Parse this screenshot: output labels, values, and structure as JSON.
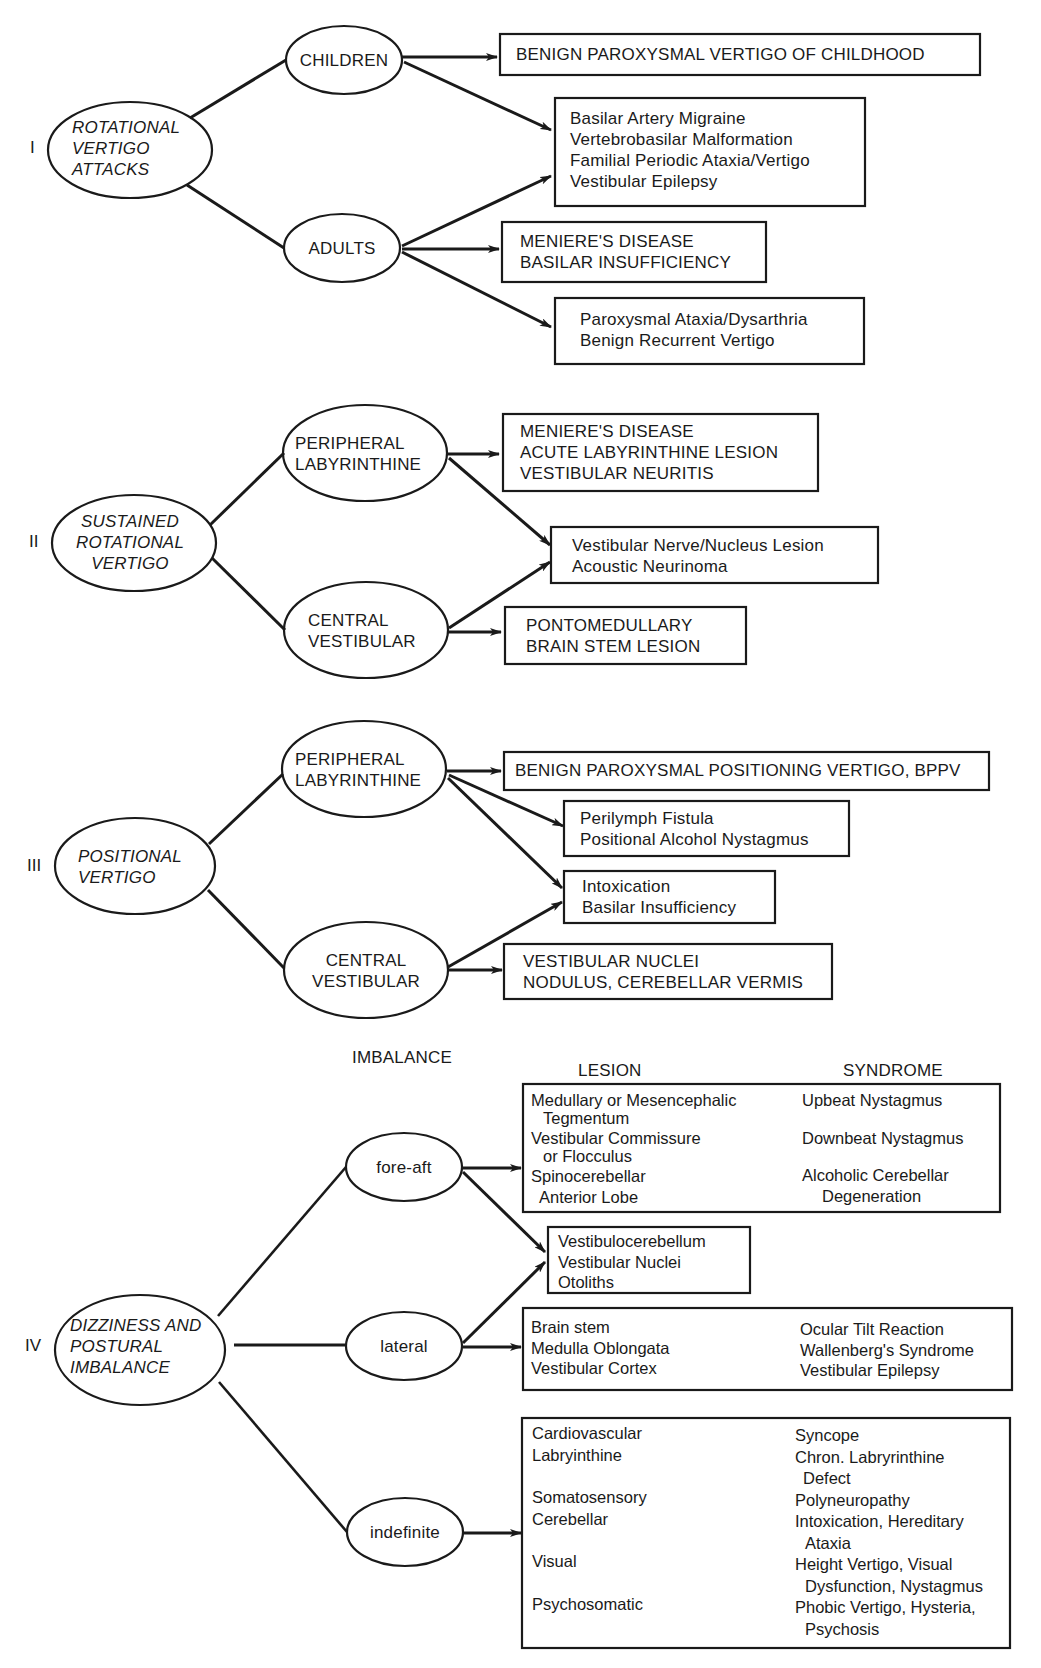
{
  "sections": [
    {
      "numeral": "I",
      "root": [
        "ROTATIONAL",
        "VERTIGO",
        "ATTACKS"
      ],
      "branches": [
        {
          "label": [
            "CHILDREN"
          ]
        },
        {
          "label": [
            "ADULTS"
          ]
        }
      ],
      "outcomes": [
        {
          "lines": [
            "BENIGN PAROXYSMAL VERTIGO OF CHILDHOOD"
          ],
          "from": [
            "CHILDREN"
          ]
        },
        {
          "lines": [
            "Basilar Artery Migraine",
            "Vertebrobasilar Malformation",
            "Familial Periodic Ataxia/Vertigo",
            "Vestibular Epilepsy"
          ],
          "from": [
            "CHILDREN",
            "ADULTS"
          ]
        },
        {
          "lines": [
            "MENIERE'S DISEASE",
            "BASILAR INSUFFICIENCY"
          ],
          "from": [
            "ADULTS"
          ]
        },
        {
          "lines": [
            "Paroxysmal Ataxia/Dysarthria",
            "Benign Recurrent Vertigo"
          ],
          "from": [
            "ADULTS"
          ]
        }
      ]
    },
    {
      "numeral": "II",
      "root": [
        "SUSTAINED",
        "ROTATIONAL",
        "VERTIGO"
      ],
      "branches": [
        {
          "label": [
            "PERIPHERAL",
            "LABYRINTHINE"
          ]
        },
        {
          "label": [
            "CENTRAL",
            "VESTIBULAR"
          ]
        }
      ],
      "outcomes": [
        {
          "lines": [
            "MENIERE'S DISEASE",
            "ACUTE LABYRINTHINE LESION",
            "VESTIBULAR NEURITIS"
          ],
          "from": [
            "PERIPHERAL LABYRINTHINE"
          ]
        },
        {
          "lines": [
            "Vestibular Nerve/Nucleus Lesion",
            "Acoustic Neurinoma"
          ],
          "from": [
            "PERIPHERAL LABYRINTHINE",
            "CENTRAL VESTIBULAR"
          ]
        },
        {
          "lines": [
            "PONTOMEDULLARY",
            "BRAIN STEM LESION"
          ],
          "from": [
            "CENTRAL VESTIBULAR"
          ]
        }
      ]
    },
    {
      "numeral": "III",
      "root": [
        "POSITIONAL",
        "VERTIGO"
      ],
      "branches": [
        {
          "label": [
            "PERIPHERAL",
            "LABYRINTHINE"
          ]
        },
        {
          "label": [
            "CENTRAL",
            "VESTIBULAR"
          ]
        }
      ],
      "outcomes": [
        {
          "lines": [
            "BENIGN PAROXYSMAL POSITIONING VERTIGO, BPPV"
          ],
          "from": [
            "PERIPHERAL LABYRINTHINE"
          ]
        },
        {
          "lines": [
            "Perilymph Fistula",
            "Positional Alcohol Nystagmus"
          ],
          "from": [
            "PERIPHERAL LABYRINTHINE"
          ]
        },
        {
          "lines": [
            "Intoxication",
            "Basilar Insufficiency"
          ],
          "from": [
            "PERIPHERAL LABYRINTHINE",
            "CENTRAL VESTIBULAR"
          ]
        },
        {
          "lines": [
            "VESTIBULAR NUCLEI",
            "NODULUS, CEREBELLAR VERMIS"
          ],
          "from": [
            "CENTRAL VESTIBULAR"
          ]
        }
      ]
    },
    {
      "numeral": "IV",
      "root": [
        "DIZZINESS AND",
        "POSTURAL",
        "IMBALANCE"
      ],
      "column_header": "IMBALANCE",
      "table_headers": {
        "lesion": "LESION",
        "syndrome": "SYNDROME"
      },
      "branches": [
        {
          "label": [
            "fore-aft"
          ]
        },
        {
          "label": [
            "lateral"
          ]
        },
        {
          "label": [
            "indefinite"
          ]
        }
      ],
      "outcomes": [
        {
          "from": [
            "fore-aft"
          ],
          "rows": [
            {
              "lesion": [
                "Medullary or Mesencephalic",
                "Tegmentum"
              ],
              "syndrome": [
                "Upbeat Nystagmus"
              ]
            },
            {
              "lesion": [
                "Vestibular Commissure",
                "or Flocculus"
              ],
              "syndrome": [
                "Downbeat Nystagmus"
              ]
            },
            {
              "lesion": [
                "Spinocerebellar",
                "Anterior Lobe"
              ],
              "syndrome": [
                "Alcoholic Cerebellar",
                "Degeneration"
              ]
            }
          ]
        },
        {
          "from": [
            "fore-aft",
            "lateral"
          ],
          "lines": [
            "Vestibulocerebellum",
            "Vestibular Nuclei",
            "Otoliths"
          ]
        },
        {
          "from": [
            "lateral"
          ],
          "rows": [
            {
              "lesion": [
                "Brain stem"
              ],
              "syndrome": [
                "Ocular Tilt Reaction"
              ]
            },
            {
              "lesion": [
                "Medulla Oblongata"
              ],
              "syndrome": [
                "Wallenberg's Syndrome"
              ]
            },
            {
              "lesion": [
                "Vestibular Cortex"
              ],
              "syndrome": [
                "Vestibular Epilepsy"
              ]
            }
          ]
        },
        {
          "from": [
            "indefinite"
          ],
          "rows": [
            {
              "lesion": [
                "Cardiovascular"
              ],
              "syndrome": [
                "Syncope"
              ]
            },
            {
              "lesion": [
                "Labryinthine"
              ],
              "syndrome": [
                "Chron. Labryrinthine",
                "Defect"
              ]
            },
            {
              "lesion": [
                "Somatosensory"
              ],
              "syndrome": [
                "Polyneuropathy"
              ]
            },
            {
              "lesion": [
                "Cerebellar"
              ],
              "syndrome": [
                "Intoxication, Hereditary",
                "Ataxia"
              ]
            },
            {
              "lesion": [
                "Visual"
              ],
              "syndrome": [
                "Height Vertigo, Visual",
                "Dysfunction, Nystagmus"
              ]
            },
            {
              "lesion": [
                "Psychosomatic"
              ],
              "syndrome": [
                "Phobic Vertigo, Hysteria,",
                "Psychosis"
              ]
            }
          ]
        }
      ]
    }
  ]
}
